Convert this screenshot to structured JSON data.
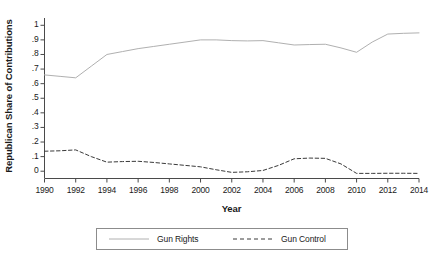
{
  "chart_data": {
    "type": "line",
    "title": "",
    "xlabel": "Year",
    "ylabel": "Republican Share of Contributions",
    "xlim": [
      1990,
      2014
    ],
    "ylim": [
      -0.05,
      1.05
    ],
    "grid": false,
    "legend_position": "bottom",
    "x": [
      1990,
      1991,
      1992,
      1993,
      1994,
      1995,
      1996,
      1997,
      1998,
      1999,
      2000,
      2001,
      2002,
      2003,
      2004,
      2005,
      2006,
      2007,
      2008,
      2009,
      2010,
      2011,
      2012,
      2013,
      2014
    ],
    "xticks": [
      "1990",
      "1992",
      "1994",
      "1996",
      "1998",
      "2000",
      "2002",
      "2004",
      "2006",
      "2008",
      "2010",
      "2012",
      "2014"
    ],
    "xtick_values": [
      1990,
      1992,
      1994,
      1996,
      1998,
      2000,
      2002,
      2004,
      2006,
      2008,
      2010,
      2012,
      2014
    ],
    "yticks": [
      "0",
      ".1",
      ".2",
      ".3",
      ".4",
      ".5",
      ".6",
      ".7",
      ".8",
      ".9",
      "1"
    ],
    "ytick_values": [
      0,
      0.1,
      0.2,
      0.3,
      0.4,
      0.5,
      0.6,
      0.7,
      0.8,
      0.9,
      1
    ],
    "series": [
      {
        "name": "Gun Rights",
        "style": "solid",
        "color": "#b0b0b0",
        "values": [
          0.66,
          0.65,
          0.64,
          0.72,
          0.8,
          0.82,
          0.84,
          0.855,
          0.87,
          0.885,
          0.9,
          0.9,
          0.895,
          0.893,
          0.895,
          0.88,
          0.865,
          0.868,
          0.87,
          0.845,
          0.815,
          0.885,
          0.94,
          0.945,
          0.948
        ]
      },
      {
        "name": "Gun Control",
        "style": "dashed",
        "color": "#3a3a3a",
        "values": [
          0.137,
          0.14,
          0.146,
          0.1,
          0.062,
          0.066,
          0.068,
          0.06,
          0.05,
          0.04,
          0.03,
          0.01,
          -0.008,
          -0.004,
          0.005,
          0.04,
          0.085,
          0.09,
          0.088,
          0.05,
          -0.015,
          -0.015,
          -0.014,
          -0.014,
          -0.015
        ]
      }
    ]
  },
  "legend": {
    "entries": [
      {
        "label": "Gun Rights"
      },
      {
        "label": "Gun Control"
      }
    ]
  }
}
